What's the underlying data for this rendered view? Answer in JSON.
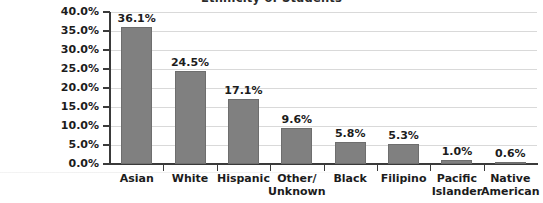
{
  "chart_data": {
    "type": "bar",
    "title": "Ethnicity of Students",
    "xlabel": "",
    "ylabel": "",
    "ylim": [
      0,
      40
    ],
    "ytick_labels": [
      "40.0%",
      "35.0%",
      "30.0%",
      "25.0%",
      "20.0%",
      "15.0%",
      "10.0%",
      "5.0%",
      "0.0%"
    ],
    "ytick_values": [
      40,
      35,
      30,
      25,
      20,
      15,
      10,
      5,
      0
    ],
    "grid": true,
    "legend": false,
    "categories": [
      "Asian",
      "White",
      "Hispanic",
      "Other/\nUnknown",
      "Black",
      "Filipino",
      "Pacific\nIslander",
      "Native\nAmerican"
    ],
    "values": [
      36.1,
      24.5,
      17.1,
      9.6,
      5.8,
      5.3,
      1.0,
      0.6
    ],
    "value_labels": [
      "36.1%",
      "24.5%",
      "17.1%",
      "9.6%",
      "5.8%",
      "5.3%",
      "1.0%",
      "0.6%"
    ],
    "bar_color": "#808080",
    "bar_edge_color": "#6e6e6e",
    "grid_color": "#d9d9d9",
    "axis_color": "#3a3a3a",
    "text_color": "#1c1c1c",
    "background": "#ffffff"
  }
}
